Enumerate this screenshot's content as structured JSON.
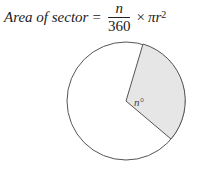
{
  "formula": {
    "lhs": "Area of  sector",
    "equals": "=",
    "numerator": "n",
    "denominator": "360",
    "times": "×",
    "pi_r": "πr",
    "exponent": "2"
  },
  "diagram": {
    "angle_label": "n°",
    "shade_color": "#e6e6e6",
    "stroke_color": "#555555",
    "circle": {
      "cx": 126,
      "cy": 101,
      "r": 59
    },
    "sector_points": {
      "p1": [
        143,
        44
      ],
      "p2": [
        171,
        139
      ]
    }
  }
}
